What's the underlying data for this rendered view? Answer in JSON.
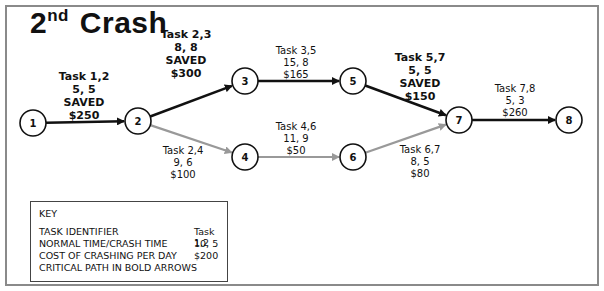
{
  "title": {
    "main": "Crash",
    "ordinal_number": "2",
    "ordinal_suffix": "nd"
  },
  "nodes": [
    "1",
    "2",
    "3",
    "4",
    "5",
    "6",
    "7",
    "8"
  ],
  "edges": [
    {
      "id": "task-1-2",
      "from": "1",
      "to": "2",
      "critical": true,
      "task": "Task 1,2",
      "times": "5, 5",
      "status": "SAVED",
      "cost": "$250"
    },
    {
      "id": "task-2-3",
      "from": "2",
      "to": "3",
      "critical": true,
      "task": "Task 2,3",
      "times": "8, 8",
      "status": "SAVED",
      "cost": "$300"
    },
    {
      "id": "task-2-4",
      "from": "2",
      "to": "4",
      "critical": false,
      "task": "Task 2,4",
      "times": "9, 6",
      "status": "",
      "cost": "$100"
    },
    {
      "id": "task-3-5",
      "from": "3",
      "to": "5",
      "critical": true,
      "task": "Task 3,5",
      "times": "15, 8",
      "status": "",
      "cost": "$165"
    },
    {
      "id": "task-4-6",
      "from": "4",
      "to": "6",
      "critical": false,
      "task": "Task 4,6",
      "times": "11, 9",
      "status": "",
      "cost": "$50"
    },
    {
      "id": "task-5-7",
      "from": "5",
      "to": "7",
      "critical": true,
      "task": "Task 5,7",
      "times": "5, 5",
      "status": "SAVED",
      "cost": "$150"
    },
    {
      "id": "task-6-7",
      "from": "6",
      "to": "7",
      "critical": false,
      "task": "Task 6,7",
      "times": "8, 5",
      "status": "",
      "cost": "$80"
    },
    {
      "id": "task-7-8",
      "from": "7",
      "to": "8",
      "critical": true,
      "task": "Task 7,8",
      "times": "5, 3",
      "status": "",
      "cost": "$260"
    }
  ],
  "colors": {
    "critical": "#111111",
    "noncritical": "#999999",
    "frame": "#8a8a8a"
  },
  "key": {
    "title": "KEY",
    "rows": [
      {
        "label": "TASK IDENTIFIER",
        "value": "Task 1,2"
      },
      {
        "label": "NORMAL TIME/CRASH TIME",
        "value": "10, 5"
      },
      {
        "label": "COST OF CRASHING PER DAY",
        "value": "$200"
      },
      {
        "label": "CRITICAL PATH IN BOLD ARROWS",
        "value": ""
      }
    ]
  }
}
